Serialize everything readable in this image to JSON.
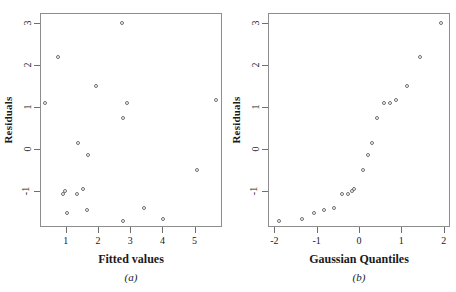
{
  "figure": {
    "background_color": "#ffffff",
    "frame_color": "#8d8d8d",
    "marker_color": "#6f6f6f",
    "panel_a_caption": "(a)",
    "panel_b_caption": "(b)"
  },
  "chart_data": [
    {
      "type": "scatter",
      "title": "",
      "panel_label": "(a)",
      "xlabel": "Fitted values",
      "ylabel": "Residuals",
      "xlim": [
        0.2,
        5.85
      ],
      "ylim": [
        -1.85,
        3.25
      ],
      "xticks": [
        1,
        2,
        3,
        4,
        5
      ],
      "xticklabels": [
        "1",
        "2",
        "3",
        "4",
        "5"
      ],
      "yticks": [
        -1,
        0,
        1,
        2,
        3
      ],
      "yticklabels": [
        "-1",
        "0",
        "1",
        "2",
        "3"
      ],
      "grid": false,
      "legend": false,
      "marker": "open-circle",
      "points": [
        {
          "x": 0.33,
          "y": 1.14
        },
        {
          "x": 0.72,
          "y": 2.22
        },
        {
          "x": 0.88,
          "y": -1.05
        },
        {
          "x": 0.95,
          "y": -0.97
        },
        {
          "x": 1.0,
          "y": -1.5
        },
        {
          "x": 1.32,
          "y": -1.03
        },
        {
          "x": 1.35,
          "y": 0.18
        },
        {
          "x": 1.5,
          "y": -0.92
        },
        {
          "x": 1.62,
          "y": -1.42
        },
        {
          "x": 1.65,
          "y": -0.1
        },
        {
          "x": 1.9,
          "y": 1.53
        },
        {
          "x": 2.73,
          "y": 3.04
        },
        {
          "x": 2.75,
          "y": 0.76
        },
        {
          "x": 2.76,
          "y": -1.69
        },
        {
          "x": 2.86,
          "y": 1.14
        },
        {
          "x": 3.4,
          "y": -1.38
        },
        {
          "x": 4.0,
          "y": -1.63
        },
        {
          "x": 5.05,
          "y": -0.46
        },
        {
          "x": 5.62,
          "y": 1.21
        }
      ]
    },
    {
      "type": "scatter",
      "title": "",
      "panel_label": "(b)",
      "xlabel": "Gaussian Quantiles",
      "ylabel": "Residuals",
      "xlim": [
        -2.15,
        2.15
      ],
      "ylim": [
        -1.85,
        3.25
      ],
      "xticks": [
        -2,
        -1,
        0,
        1,
        2
      ],
      "xticklabels": [
        "-2",
        "-1",
        "0",
        "1",
        "2"
      ],
      "yticks": [
        -1,
        0,
        1,
        2,
        3
      ],
      "yticklabels": [
        "-1",
        "0",
        "1",
        "2",
        "3"
      ],
      "grid": false,
      "legend": false,
      "marker": "open-circle",
      "points": [
        {
          "x": -1.92,
          "y": -1.69
        },
        {
          "x": -1.38,
          "y": -1.63
        },
        {
          "x": -1.08,
          "y": -1.5
        },
        {
          "x": -0.85,
          "y": -1.42
        },
        {
          "x": -0.62,
          "y": -1.38
        },
        {
          "x": -0.43,
          "y": -1.05
        },
        {
          "x": -0.28,
          "y": -1.03
        },
        {
          "x": -0.18,
          "y": -0.97
        },
        {
          "x": -0.13,
          "y": -0.92
        },
        {
          "x": 0.06,
          "y": -0.46
        },
        {
          "x": 0.2,
          "y": -0.1
        },
        {
          "x": 0.28,
          "y": 0.18
        },
        {
          "x": 0.4,
          "y": 0.76
        },
        {
          "x": 0.56,
          "y": 1.14
        },
        {
          "x": 0.7,
          "y": 1.14
        },
        {
          "x": 0.86,
          "y": 1.21
        },
        {
          "x": 1.1,
          "y": 1.53
        },
        {
          "x": 1.41,
          "y": 2.22
        },
        {
          "x": 1.92,
          "y": 3.04
        }
      ]
    }
  ]
}
